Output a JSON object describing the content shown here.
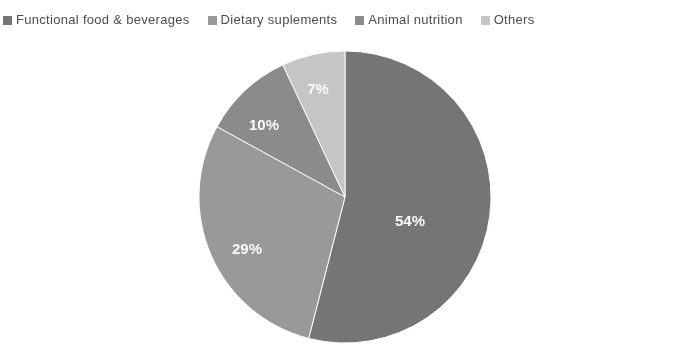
{
  "chart_data": {
    "type": "pie",
    "title": "",
    "categories": [
      "Functional food & beverages",
      "Dietary suplements",
      "Animal nutrition",
      "Others"
    ],
    "values": [
      54,
      29,
      10,
      7
    ],
    "value_labels": [
      "54%",
      "29%",
      "10%",
      "7%"
    ],
    "unit": "%",
    "total": 100,
    "start_angle_deg": 0,
    "direction": "clockwise",
    "legend_position": "top",
    "grid": false,
    "colors": [
      "#757575",
      "#9a9a9a",
      "#8b8b8b",
      "#c8c8c8"
    ]
  },
  "legend": {
    "items": [
      {
        "label": "Functional food & beverages",
        "color": "#757575",
        "marker": "square-marker"
      },
      {
        "label": "Dietary suplements",
        "color": "#9a9a9a",
        "marker": "square-marker"
      },
      {
        "label": "Animal nutrition",
        "color": "#8b8b8b",
        "marker": "square-marker"
      },
      {
        "label": "Others",
        "color": "#c8c8c8",
        "marker": "square-marker"
      }
    ]
  },
  "pie": {
    "slices": [
      {
        "name": "Functional food & beverages",
        "value": 54,
        "label": "54%",
        "color": "#757575",
        "label_x": 212,
        "label_y": 172
      },
      {
        "name": "Dietary suplements",
        "value": 29,
        "label": "29%",
        "color": "#9a9a9a",
        "label_x": 49,
        "label_y": 200
      },
      {
        "name": "Animal nutrition",
        "value": 10,
        "label": "10%",
        "color": "#8b8b8b",
        "label_x": 66,
        "label_y": 76
      },
      {
        "name": "Others",
        "value": 7,
        "label": "7%",
        "color": "#c8c8c8",
        "label_x": 120,
        "label_y": 40
      }
    ]
  }
}
